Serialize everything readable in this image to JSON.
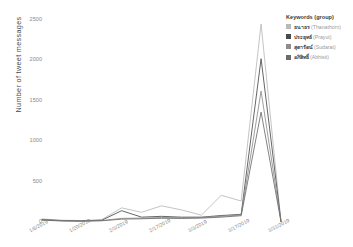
{
  "chart_data": {
    "type": "line",
    "title": "",
    "xlabel": "",
    "ylabel": "Number of tweet messages",
    "ylim": [
      0,
      2500
    ],
    "yticks": [
      0,
      500,
      1000,
      1500,
      2000,
      2500
    ],
    "ytick_labels": [
      "0",
      "500",
      "1000",
      "1500",
      "2000",
      "2500"
    ],
    "grid": false,
    "legend_position": "right",
    "legend_title": "Keywords (group)",
    "x": [
      "1/6/2019",
      "1/13/2019",
      "1/20/2019",
      "1/27/2019",
      "2/3/2019",
      "2/10/2019",
      "2/17/2019",
      "2/24/2019",
      "3/3/2019",
      "3/10/2019",
      "3/17/2019",
      "3/24/2019",
      "3/31/2019"
    ],
    "xtick_labels": [
      "1/6/2019",
      "1/20/2019",
      "2/3/2019",
      "2/17/2019",
      "3/3/2019",
      "3/17/2019",
      "3/31/2019"
    ],
    "xtick_indices": [
      0,
      2,
      4,
      6,
      8,
      10,
      12
    ],
    "series": [
      {
        "name": "ธนาธร",
        "translit": "(Thanathorn)",
        "color": "#b9b9b9",
        "values": [
          38,
          22,
          18,
          30,
          175,
          120,
          200,
          150,
          85,
          330,
          260,
          2450,
          8
        ]
      },
      {
        "name": "ประยุทธ์",
        "translit": "(Prayut)",
        "color": "#4a4a4a",
        "values": [
          30,
          18,
          14,
          22,
          140,
          60,
          70,
          60,
          60,
          80,
          95,
          2020,
          6
        ]
      },
      {
        "name": "สุดารัตน์",
        "translit": "(Sudarat)",
        "color": "#8c8c8c",
        "values": [
          26,
          15,
          12,
          18,
          45,
          48,
          55,
          52,
          55,
          70,
          88,
          1620,
          5
        ]
      },
      {
        "name": "อภิสิทธิ์",
        "translit": "(Abhisit)",
        "color": "#6b6b6b",
        "values": [
          22,
          13,
          10,
          15,
          35,
          40,
          46,
          44,
          48,
          60,
          78,
          1360,
          4
        ]
      }
    ]
  }
}
